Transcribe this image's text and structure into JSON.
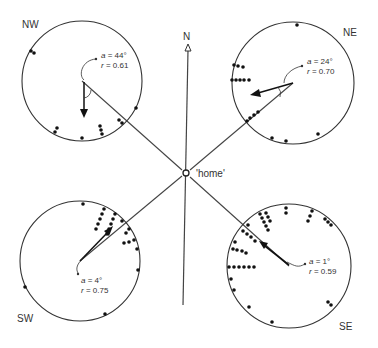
{
  "diagram": {
    "north_label": "N",
    "home_label": "'home'",
    "panels": [
      {
        "id": "nw",
        "label": "NW",
        "a_label": "a",
        "a_value": " = 44°",
        "r_label": "r",
        "r_value": " = 0.61"
      },
      {
        "id": "ne",
        "label": "NE",
        "a_label": "a",
        "a_value": " = 24°",
        "r_label": "r",
        "r_value": " = 0.70"
      },
      {
        "id": "sw",
        "label": "SW",
        "a_label": "a",
        "a_value": " = 4°",
        "r_label": "r",
        "r_value": " = 0.75"
      },
      {
        "id": "se",
        "label": "SE",
        "a_label": "a",
        "a_value": " = 1°",
        "r_label": "r",
        "r_value": " = 0.59"
      }
    ],
    "colors": {
      "line": "#333333",
      "dot": "#111111",
      "background": "#ffffff"
    }
  }
}
